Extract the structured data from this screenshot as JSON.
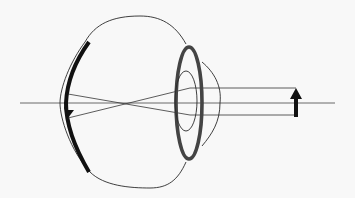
{
  "diagram": {
    "colors": {
      "background": "#f8f8f8",
      "outline": "#2a2a2a",
      "retina": "#111111",
      "iris": "#444444",
      "object_arrow": "#111111"
    },
    "elements": [
      {
        "id": "optical-axis",
        "label": ""
      },
      {
        "id": "eyeball-outline",
        "label": ""
      },
      {
        "id": "retina",
        "label": ""
      },
      {
        "id": "lens-iris",
        "label": ""
      },
      {
        "id": "pupil",
        "label": ""
      },
      {
        "id": "cornea",
        "label": ""
      },
      {
        "id": "object-arrow",
        "label": "",
        "direction": "up"
      },
      {
        "id": "image-arrow",
        "label": "",
        "direction": "down"
      },
      {
        "id": "rays",
        "count": 3
      }
    ]
  }
}
